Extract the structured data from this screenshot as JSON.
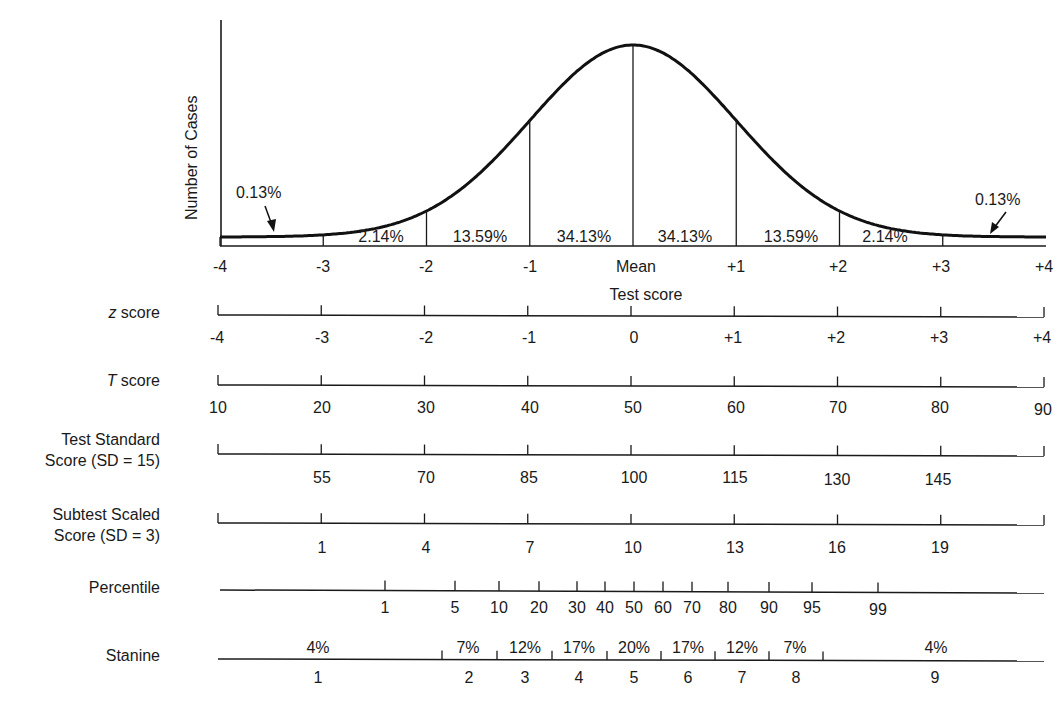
{
  "chart_data": {
    "type": "area",
    "title": "",
    "ylabel": "Number of Cases",
    "xlabel": "Test score",
    "curve": "normal distribution",
    "x_ticks": [
      "-4",
      "-3",
      "-2",
      "-1",
      "Mean",
      "+1",
      "+2",
      "+3",
      "+4"
    ],
    "x_values": [
      -4,
      -3,
      -2,
      -1,
      0,
      1,
      2,
      3,
      4
    ],
    "xlim": [
      -4,
      4
    ],
    "regions": [
      {
        "range": [
          -4,
          -3
        ],
        "percent": "0.13%"
      },
      {
        "range": [
          -3,
          -2
        ],
        "percent": "2.14%"
      },
      {
        "range": [
          -2,
          -1
        ],
        "percent": "13.59%"
      },
      {
        "range": [
          -1,
          0
        ],
        "percent": "34.13%"
      },
      {
        "range": [
          0,
          1
        ],
        "percent": "34.13%"
      },
      {
        "range": [
          1,
          2
        ],
        "percent": "13.59%"
      },
      {
        "range": [
          2,
          3
        ],
        "percent": "2.14%"
      },
      {
        "range": [
          3,
          4
        ],
        "percent": "0.13%"
      }
    ],
    "scales": [
      {
        "name": "z score",
        "ticks": [
          "-4",
          "-3",
          "-2",
          "-1",
          "0",
          "+1",
          "+2",
          "+3",
          "+4"
        ]
      },
      {
        "name": "T score",
        "ticks": [
          "10",
          "20",
          "30",
          "40",
          "50",
          "60",
          "70",
          "80",
          "90"
        ]
      },
      {
        "name": "Test Standard Score (SD = 15)",
        "ticks": [
          "55",
          "70",
          "85",
          "100",
          "115",
          "130",
          "145"
        ]
      },
      {
        "name": "Subtest Scaled Score (SD = 3)",
        "ticks": [
          "1",
          "4",
          "7",
          "10",
          "13",
          "16",
          "19"
        ]
      },
      {
        "name": "Percentile",
        "ticks": [
          "1",
          "5",
          "10",
          "20",
          "30",
          "40",
          "50",
          "60",
          "70",
          "80",
          "90",
          "95",
          "99"
        ]
      },
      {
        "name": "Stanine",
        "ticks": [
          "1",
          "2",
          "3",
          "4",
          "5",
          "6",
          "7",
          "8",
          "9"
        ],
        "percents": [
          "4%",
          "7%",
          "12%",
          "17%",
          "20%",
          "17%",
          "12%",
          "7%",
          "4%"
        ]
      }
    ],
    "grid": false,
    "legend": "none"
  },
  "plot": {
    "ylabel": "Number of Cases",
    "xlabel": "Test score",
    "tail_left": "0.13%",
    "tail_right": "0.13%",
    "inner_regions": [
      "2.14%",
      "13.59%",
      "34.13%",
      "34.13%",
      "13.59%",
      "2.14%"
    ],
    "ticks": [
      "-4",
      "-3",
      "-2",
      "-1",
      "Mean",
      "+1",
      "+2",
      "+3",
      "+4"
    ]
  },
  "rows": {
    "z": {
      "label_italic": "z",
      "label_rest": " score",
      "ticks": [
        "-4",
        "-3",
        "-2",
        "-1",
        "0",
        "+1",
        "+2",
        "+3",
        "+4"
      ]
    },
    "t": {
      "label_italic": "T",
      "label_rest": " score",
      "ticks": [
        "10",
        "20",
        "30",
        "40",
        "50",
        "60",
        "70",
        "80",
        "90"
      ]
    },
    "standard": {
      "label_line1": "Test Standard",
      "label_line2": "Score (SD = 15)",
      "ticks": [
        "55",
        "70",
        "85",
        "100",
        "115",
        "130",
        "145"
      ]
    },
    "subtest": {
      "label_line1": "Subtest Scaled",
      "label_line2": "Score (SD = 3)",
      "ticks": [
        "1",
        "4",
        "7",
        "10",
        "13",
        "16",
        "19"
      ]
    },
    "percentile": {
      "label": "Percentile",
      "ticks": [
        "1",
        "5",
        "10",
        "20",
        "30",
        "40",
        "50",
        "60",
        "70",
        "80",
        "90",
        "95",
        "99"
      ]
    },
    "stanine": {
      "label": "Stanine",
      "numbers": [
        "1",
        "2",
        "3",
        "4",
        "5",
        "6",
        "7",
        "8",
        "9"
      ],
      "percents": [
        "4%",
        "7%",
        "12%",
        "17%",
        "20%",
        "17%",
        "12%",
        "7%",
        "4%"
      ]
    }
  }
}
